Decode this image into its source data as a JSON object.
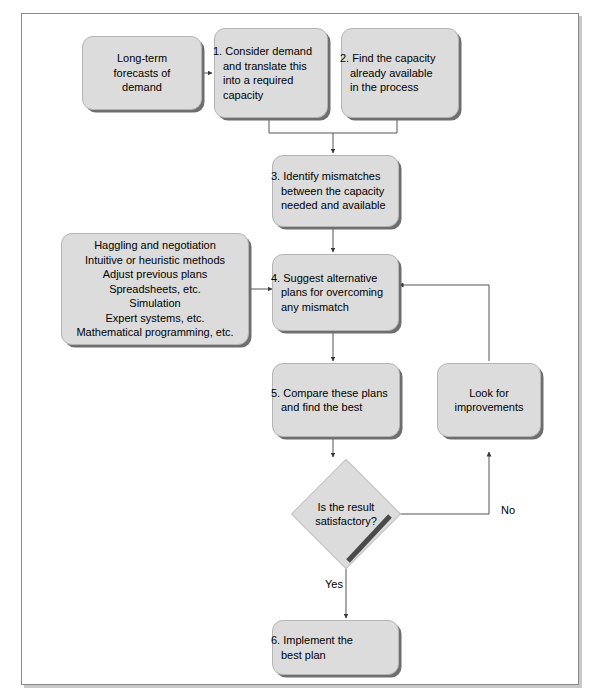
{
  "diagram": {
    "fill_color": "#dcdcdc",
    "line_color": "#555555",
    "frame_color": "#8a8a8a"
  },
  "nodes": {
    "forecasts": {
      "id": "forecasts",
      "label": "Long-term\nforecasts of\ndemand",
      "lines": [
        "Long-term",
        "forecasts of",
        "demand"
      ]
    },
    "step1": {
      "id": "step1",
      "label": "1. Consider demand and translate this into a required capacity",
      "lines": [
        "1. Consider demand",
        "and translate this",
        "into a required",
        "capacity"
      ]
    },
    "step2": {
      "id": "step2",
      "label": "2. Find the capacity already available in the process",
      "lines": [
        "2. Find the capacity",
        "already available",
        "in the process"
      ]
    },
    "step3": {
      "id": "step3",
      "label": "3. Identify mismatches between the capacity needed and available",
      "lines": [
        "3. Identify mismatches",
        "between the capacity",
        "needed and available"
      ]
    },
    "methods": {
      "id": "methods",
      "label": "Planning methods",
      "lines": [
        "Haggling and negotiation",
        "Intuitive or heuristic methods",
        "Adjust previous plans",
        "Spreadsheets, etc.",
        "Simulation",
        "Expert systems, etc.",
        "Mathematical programming, etc."
      ]
    },
    "step4": {
      "id": "step4",
      "label": "4. Suggest alternative plans for overcoming any mismatch",
      "lines": [
        "4. Suggest alternative",
        "plans for overcoming",
        "any mismatch"
      ]
    },
    "step5": {
      "id": "step5",
      "label": "5. Compare these plans and find the best",
      "lines": [
        "5. Compare these plans",
        "and find the best"
      ]
    },
    "improvements": {
      "id": "improvements",
      "label": "Look for improvements",
      "lines": [
        "Look for",
        "improvements"
      ]
    },
    "decision": {
      "id": "decision",
      "label": "Is the result satisfactory?",
      "lines": [
        "Is the result",
        "satisfactory?"
      ]
    },
    "step6": {
      "id": "step6",
      "label": "6. Implement the best plan",
      "lines": [
        "6. Implement the",
        "best plan"
      ]
    }
  },
  "edge_labels": {
    "yes": "Yes",
    "no": "No"
  }
}
